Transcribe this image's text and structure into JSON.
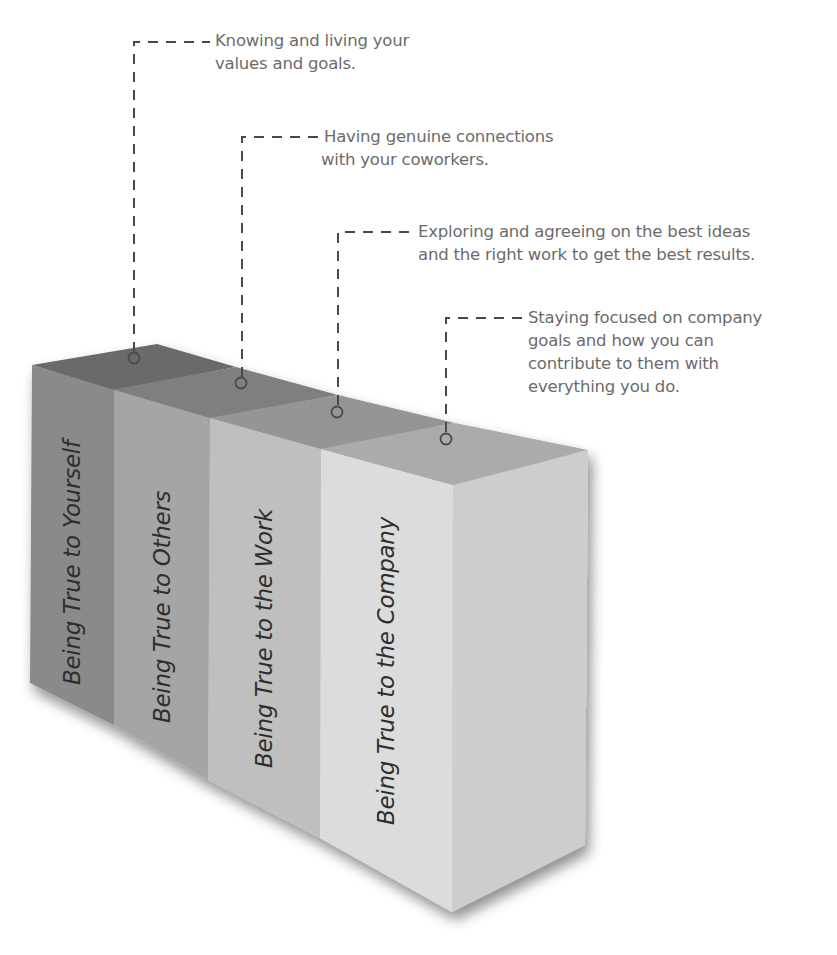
{
  "diagram": {
    "type": "3d-block-stack",
    "blocks": [
      {
        "label": "Being True to Yourself",
        "front_color": "#8a8a8a",
        "top_color": "#6b6b6b",
        "callout": [
          "Knowing and living your",
          "values and goals."
        ]
      },
      {
        "label": "Being True to Others",
        "front_color": "#a5a5a5",
        "top_color": "#7f7f7f",
        "callout": [
          "Having genuine connections",
          "with your coworkers."
        ]
      },
      {
        "label": "Being True to the Work",
        "front_color": "#bfbfbf",
        "top_color": "#959595",
        "callout": [
          "Exploring and agreeing on the best ideas",
          "and the right work to get the best results."
        ]
      },
      {
        "label": "Being True to the Company",
        "front_color": "#dcdcdc",
        "top_color": "#ababab",
        "side_color": "#cdcdcd",
        "callout": [
          "Staying focused on company",
          "goals and how you can",
          "contribute to them with",
          "everything you do."
        ]
      }
    ],
    "colors": {
      "callout_text": "#6b6b6b",
      "leader_line": "#4a4a4a",
      "label_text": "#2e2e2e"
    }
  }
}
